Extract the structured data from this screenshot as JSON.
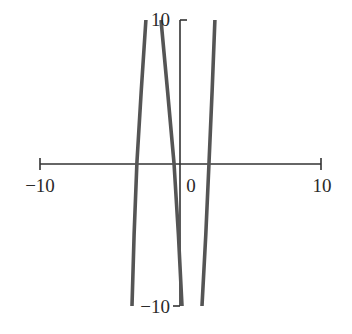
{
  "chart_data": {
    "type": "line",
    "title": "",
    "xlabel": "",
    "ylabel": "",
    "xlim": [
      -10,
      10
    ],
    "ylim": [
      -10,
      10
    ],
    "grid": false,
    "legend": null,
    "x_ticks": [
      {
        "value": -10,
        "label": "−10"
      },
      {
        "value": 0,
        "label": "0"
      },
      {
        "value": 10,
        "label": "10"
      }
    ],
    "y_ticks": [
      {
        "value": 10,
        "label": "10"
      },
      {
        "value": -10,
        "label": "−10"
      }
    ],
    "series": [
      {
        "name": "branch-1",
        "points": [
          [
            -2.46,
            10
          ],
          [
            -2.8,
            5
          ],
          [
            -3.1,
            0
          ],
          [
            -3.3,
            -5
          ],
          [
            -3.45,
            -10
          ]
        ]
      },
      {
        "name": "branch-2",
        "points": [
          [
            -1.39,
            10
          ],
          [
            -0.92,
            5
          ],
          [
            -0.46,
            0
          ],
          [
            -0.15,
            -5
          ],
          [
            0.11,
            -10
          ]
        ]
      },
      {
        "name": "branch-3",
        "points": [
          [
            2.45,
            10
          ],
          [
            2.25,
            5
          ],
          [
            2.03,
            0
          ],
          [
            1.8,
            -5
          ],
          [
            1.53,
            -10
          ]
        ]
      }
    ],
    "line_color": "#555555",
    "axis_color": "#333333"
  }
}
